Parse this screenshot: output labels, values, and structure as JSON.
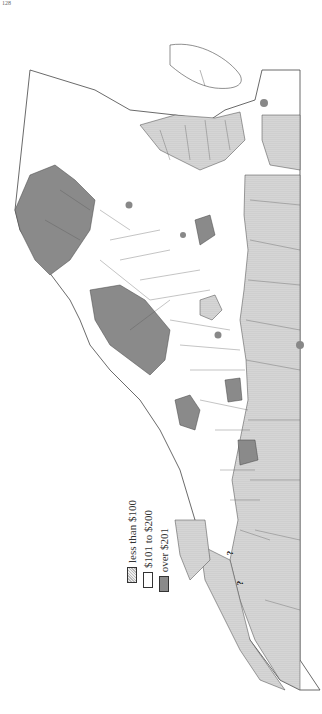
{
  "page": {
    "number": "128"
  },
  "map": {
    "title": "",
    "state": "Virginia",
    "orientation": "rotated 90° (north at right)",
    "colors": {
      "low_fill": "#d8d8d8",
      "mid_fill": "#ffffff",
      "high_fill": "#8a8a8a",
      "border": "#444444",
      "city_dot": "#888888"
    }
  },
  "legend": {
    "items": [
      {
        "label": "less than $100",
        "pattern": "dotted"
      },
      {
        "label": "$101 to $200",
        "pattern": "blank"
      },
      {
        "label": "over $201",
        "pattern": "solid-gray"
      }
    ]
  },
  "counties": {
    "high": [
      "Frederick",
      "Clarke",
      "Loudoun",
      "Fauquier",
      "Prince William",
      "Shenandoah",
      "Rockingham",
      "Augusta",
      "Rockbridge",
      "Alleghany",
      "Henrico",
      "Roanoke",
      "Pulaski"
    ],
    "mid": [
      "Warren",
      "Rappahannock",
      "Page",
      "Culpeper",
      "Madison",
      "Greene",
      "Orange",
      "Spotsylvania",
      "Stafford",
      "Caroline",
      "Louisa",
      "Albemarle",
      "Fluvanna",
      "Goochland",
      "Nelson",
      "Amherst",
      "Bedford",
      "Campbell",
      "Buckingham",
      "Cumberland",
      "Powhatan",
      "Chesterfield",
      "Amelia",
      "Prince Edward",
      "Charlotte",
      "Highland",
      "Bath",
      "Botetourt",
      "Craig",
      "Giles",
      "Montgomery",
      "Wythe",
      "Smyth",
      "Washington",
      "Surry",
      "Isle of Wight",
      "Norfolk",
      "Princess Anne",
      "Accomack",
      "Northampton",
      "Hanover",
      "King William",
      "New Kent",
      "Charles City",
      "James City",
      "Prince George",
      "Dinwiddie"
    ],
    "low": [
      "Westmoreland",
      "Northumberland",
      "Richmond",
      "Lancaster",
      "King George",
      "Essex",
      "Middlesex",
      "King and Queen",
      "Gloucester",
      "Mathews",
      "York",
      "Warwick",
      "Elizabeth City",
      "Nansemond",
      "Southampton",
      "Sussex",
      "Greensville",
      "Brunswick",
      "Mecklenburg",
      "Lunenburg",
      "Nottoway",
      "Halifax",
      "Pittsylvania",
      "Franklin",
      "Henry",
      "Patrick",
      "Floyd",
      "Carroll",
      "Grayson",
      "Bland",
      "Tazewell",
      "Russell",
      "Wise",
      "Scott",
      "Lee",
      "Appomattox"
    ],
    "unknown": [
      "Buchanan",
      "Dickenson"
    ]
  },
  "annotations": {
    "unknown_marker": "?"
  }
}
